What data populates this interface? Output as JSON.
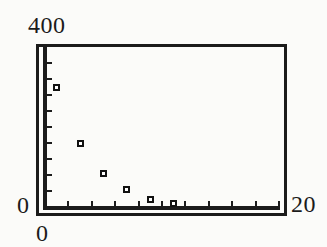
{
  "chart_data": {
    "type": "scatter",
    "points": [
      [
        1,
        300
      ],
      [
        3,
        160
      ],
      [
        5,
        85
      ],
      [
        7,
        45
      ],
      [
        9,
        20
      ],
      [
        11,
        10
      ]
    ],
    "title": "",
    "xlabel": "",
    "ylabel": "",
    "xlim": [
      0,
      20
    ],
    "ylim": [
      0,
      400
    ],
    "xscl": 2,
    "yscl": 40,
    "marker": "open-square",
    "grid": false,
    "legend": "none"
  },
  "labels": {
    "y_max": "400",
    "y_min": "0",
    "x_min": "0",
    "x_max": "20"
  },
  "colors": {
    "ink": "#1b1b1b",
    "background": "#fbfbf9",
    "marker_fill": "#ffffff"
  }
}
